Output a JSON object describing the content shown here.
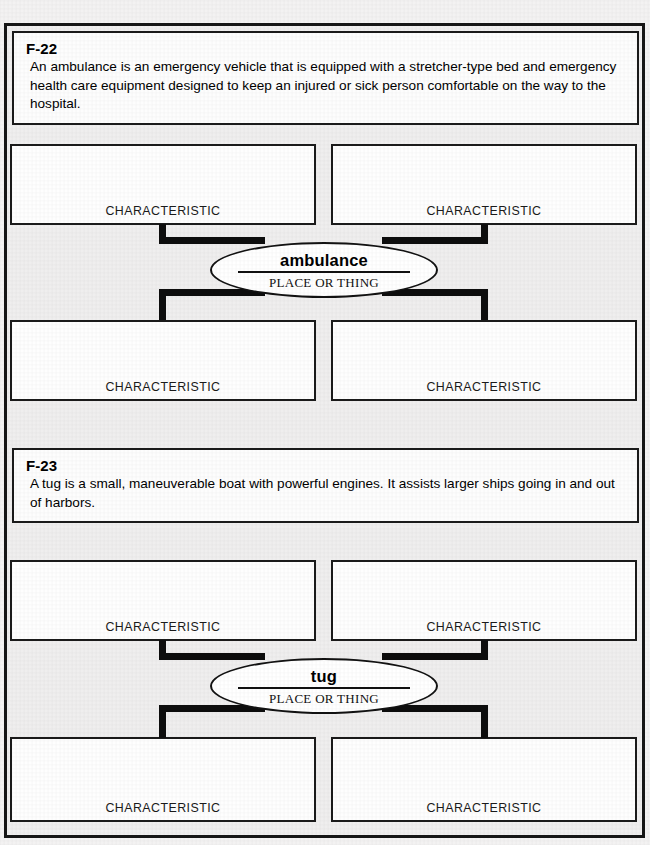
{
  "document": {
    "type": "graphic-organizer-worksheet",
    "background_color": "#efeeee",
    "ink_color": "#111111"
  },
  "sections": [
    {
      "code": "F-22",
      "prompt": "An ambulance is an emergency vehicle that is equipped with a stretcher-type bed and emergency health care equipment designed to keep an injured or sick person comfortable on the way to the hospital.",
      "center": {
        "term": "ambulance",
        "kind": "PLACE OR THING"
      },
      "characteristics": [
        {
          "label": "CHARACTERISTIC",
          "value": ""
        },
        {
          "label": "CHARACTERISTIC",
          "value": ""
        },
        {
          "label": "CHARACTERISTIC",
          "value": ""
        },
        {
          "label": "CHARACTERISTIC",
          "value": ""
        }
      ]
    },
    {
      "code": "F-23",
      "prompt": "A tug is a small, maneuverable boat with powerful engines. It assists larger ships going in and out of harbors.",
      "center": {
        "term": "tug",
        "kind": "PLACE OR THING"
      },
      "characteristics": [
        {
          "label": "CHARACTERISTIC",
          "value": ""
        },
        {
          "label": "CHARACTERISTIC",
          "value": ""
        },
        {
          "label": "CHARACTERISTIC",
          "value": ""
        },
        {
          "label": "CHARACTERISTIC",
          "value": ""
        }
      ]
    }
  ]
}
